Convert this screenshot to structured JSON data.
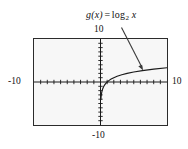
{
  "figure": {
    "background_color": "#ffffff",
    "plot_background_color": "#f7f7f7",
    "frame_color": "#2b2b2b",
    "curve_color": "#1a1a1a",
    "axis_color": "#1a1a1a",
    "annotation": {
      "function_name": "g(x)",
      "equals": "=",
      "operator": "log",
      "base": "2",
      "variable": "x",
      "full_text": "g(x) = log2 x"
    },
    "labels": {
      "y_top": "10",
      "y_bottom": "-10",
      "x_left": "-10",
      "x_right": "10"
    }
  },
  "chart_data": {
    "type": "line",
    "title": "",
    "subtitle": "",
    "xlabel": "",
    "ylabel": "",
    "xlim": [
      -10,
      10
    ],
    "ylim": [
      -10,
      10
    ],
    "grid": false,
    "legend": false,
    "axis_ticks": {
      "x_tick_interval": 1,
      "y_tick_interval": 1,
      "x_tick_values": [
        -9,
        -8,
        -7,
        -6,
        -5,
        -4,
        -3,
        -2,
        -1,
        1,
        2,
        3,
        4,
        5,
        6,
        7,
        8,
        9
      ],
      "y_tick_values": [
        -9,
        -8,
        -7,
        -6,
        -5,
        -4,
        -3,
        -2,
        -1,
        1,
        2,
        3,
        4,
        5,
        6,
        7,
        8,
        9
      ]
    },
    "annotations": [
      {
        "text": "g(x) = log2 x",
        "type": "callout-with-arrow",
        "points_to_x": 6.2,
        "points_to_y": 2.6
      }
    ],
    "series": [
      {
        "name": "g(x) = log2 x",
        "formula": "log base 2 of x",
        "domain": [
          0.06,
          10
        ],
        "x": [
          0.06,
          0.08,
          0.1,
          0.13,
          0.16,
          0.2,
          0.25,
          0.32,
          0.4,
          0.5,
          0.63,
          0.8,
          1.0,
          1.3,
          1.6,
          2.0,
          2.5,
          3.2,
          4.0,
          5.0,
          6.3,
          8.0,
          10.0
        ],
        "y": [
          -4.06,
          -3.64,
          -3.32,
          -2.94,
          -2.64,
          -2.32,
          -2.0,
          -1.64,
          -1.32,
          -1.0,
          -0.67,
          -0.32,
          0.0,
          0.38,
          0.68,
          1.0,
          1.32,
          1.68,
          2.0,
          2.32,
          2.66,
          3.0,
          3.32
        ]
      }
    ]
  }
}
